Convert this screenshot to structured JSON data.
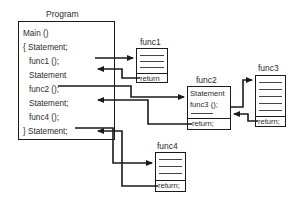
{
  "diagram": {
    "title_label": "Program",
    "main_block": {
      "name": "Main",
      "lines": [
        "Main ()",
        "{ Statement;",
        "func1 ();",
        "Statement",
        "func2 ();",
        "Statement;",
        "func4 ();",
        "} Statement;"
      ]
    },
    "functions": [
      {
        "id": "func1",
        "label": "func1",
        "body_lines": [],
        "rule_count": 3,
        "return_label": "return"
      },
      {
        "id": "func2",
        "label": "func2",
        "body_lines": [
          "Statement",
          "func3 ();"
        ],
        "rule_count": 1,
        "return_label": "return;"
      },
      {
        "id": "func3",
        "label": "func3",
        "body_lines": [],
        "rule_count": 5,
        "return_label": "return;"
      },
      {
        "id": "func4",
        "label": "func4",
        "body_lines": [],
        "rule_count": 4,
        "return_label": "return;"
      }
    ],
    "colors": {
      "stroke": "#1a1a1a",
      "line": "#444444",
      "text": "#2b2b2b",
      "background": "#ffffff"
    }
  }
}
